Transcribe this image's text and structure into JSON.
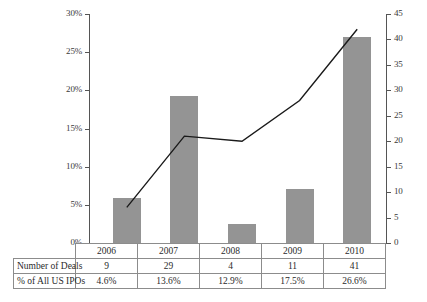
{
  "chart_data": {
    "type": "bar",
    "title": "",
    "xlabel": "",
    "ylabel": "",
    "grid": false,
    "legend": "none",
    "categories": [
      "2006",
      "2007",
      "2008",
      "2009",
      "2010"
    ],
    "axes": {
      "left": {
        "label": "",
        "ticks": [
          "0%",
          "5%",
          "10%",
          "15%",
          "20%",
          "25%",
          "30%"
        ],
        "tick_values": [
          0,
          5,
          10,
          15,
          20,
          25,
          30
        ],
        "ylim": [
          0,
          30
        ],
        "unit": "percent"
      },
      "right": {
        "label": "",
        "ticks": [
          "0",
          "5",
          "10",
          "15",
          "20",
          "25",
          "30",
          "35",
          "40",
          "45"
        ],
        "tick_values": [
          0,
          5,
          10,
          15,
          20,
          25,
          30,
          35,
          40,
          45
        ],
        "ylim": [
          0,
          45
        ],
        "unit": "count"
      }
    },
    "series": [
      {
        "name": "% of All US IPOs",
        "type": "bar",
        "axis": "left",
        "color": "#949494",
        "values": [
          5.9,
          19.2,
          2.5,
          7.1,
          27.0
        ]
      },
      {
        "name": "Number of Deals",
        "type": "line",
        "axis": "right",
        "color": "#1a1a1a",
        "values": [
          7,
          21,
          20,
          28,
          42
        ]
      }
    ]
  },
  "table": {
    "columns": [
      "2006",
      "2007",
      "2008",
      "2009",
      "2010"
    ],
    "rows": [
      {
        "label": "Number of Deals",
        "values": [
          "9",
          "29",
          "4",
          "11",
          "41"
        ]
      },
      {
        "label": "% of All US IPOs",
        "values": [
          "4.6%",
          "13.6%",
          "12.9%",
          "17.5%",
          "26.6%"
        ]
      }
    ]
  }
}
